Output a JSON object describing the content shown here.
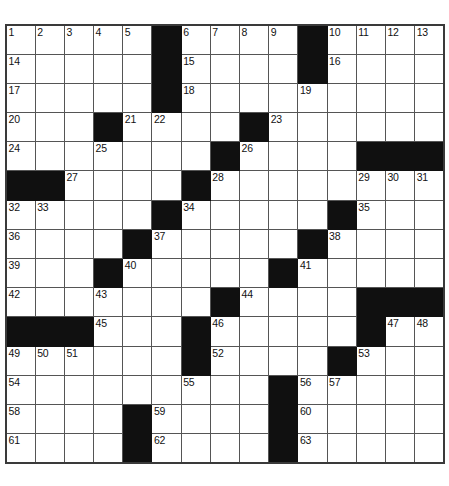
{
  "puzzle": {
    "type": "crossword-grid",
    "rows": 15,
    "cols": 15,
    "cell_size_px": 29.2,
    "colors": {
      "block_fill": "#101010",
      "cell_fill": "#ffffff",
      "grid_line": "#555555",
      "outer_border": "#3a3a3a",
      "number_text": "#111111"
    },
    "grid": [
      [
        {
          "block": false,
          "number": "1"
        },
        {
          "block": false,
          "number": "2"
        },
        {
          "block": false,
          "number": "3"
        },
        {
          "block": false,
          "number": "4"
        },
        {
          "block": false,
          "number": "5"
        },
        {
          "block": true,
          "number": ""
        },
        {
          "block": false,
          "number": "6"
        },
        {
          "block": false,
          "number": "7"
        },
        {
          "block": false,
          "number": "8"
        },
        {
          "block": false,
          "number": "9"
        },
        {
          "block": true,
          "number": ""
        },
        {
          "block": false,
          "number": "10"
        },
        {
          "block": false,
          "number": "11"
        },
        {
          "block": false,
          "number": "12"
        },
        {
          "block": false,
          "number": "13"
        }
      ],
      [
        {
          "block": false,
          "number": "14"
        },
        {
          "block": false,
          "number": ""
        },
        {
          "block": false,
          "number": ""
        },
        {
          "block": false,
          "number": ""
        },
        {
          "block": false,
          "number": ""
        },
        {
          "block": true,
          "number": ""
        },
        {
          "block": false,
          "number": "15"
        },
        {
          "block": false,
          "number": ""
        },
        {
          "block": false,
          "number": ""
        },
        {
          "block": false,
          "number": ""
        },
        {
          "block": true,
          "number": ""
        },
        {
          "block": false,
          "number": "16"
        },
        {
          "block": false,
          "number": ""
        },
        {
          "block": false,
          "number": ""
        },
        {
          "block": false,
          "number": ""
        }
      ],
      [
        {
          "block": false,
          "number": "17"
        },
        {
          "block": false,
          "number": ""
        },
        {
          "block": false,
          "number": ""
        },
        {
          "block": false,
          "number": ""
        },
        {
          "block": false,
          "number": ""
        },
        {
          "block": true,
          "number": ""
        },
        {
          "block": false,
          "number": "18"
        },
        {
          "block": false,
          "number": ""
        },
        {
          "block": false,
          "number": ""
        },
        {
          "block": false,
          "number": ""
        },
        {
          "block": false,
          "number": "19"
        },
        {
          "block": false,
          "number": ""
        },
        {
          "block": false,
          "number": ""
        },
        {
          "block": false,
          "number": ""
        },
        {
          "block": false,
          "number": ""
        }
      ],
      [
        {
          "block": false,
          "number": "20"
        },
        {
          "block": false,
          "number": ""
        },
        {
          "block": false,
          "number": ""
        },
        {
          "block": true,
          "number": ""
        },
        {
          "block": false,
          "number": "21"
        },
        {
          "block": false,
          "number": "22"
        },
        {
          "block": false,
          "number": ""
        },
        {
          "block": false,
          "number": ""
        },
        {
          "block": true,
          "number": ""
        },
        {
          "block": false,
          "number": "23"
        },
        {
          "block": false,
          "number": ""
        },
        {
          "block": false,
          "number": ""
        },
        {
          "block": false,
          "number": ""
        },
        {
          "block": false,
          "number": ""
        },
        {
          "block": false,
          "number": ""
        }
      ],
      [
        {
          "block": false,
          "number": "24"
        },
        {
          "block": false,
          "number": ""
        },
        {
          "block": false,
          "number": ""
        },
        {
          "block": false,
          "number": "25"
        },
        {
          "block": false,
          "number": ""
        },
        {
          "block": false,
          "number": ""
        },
        {
          "block": false,
          "number": ""
        },
        {
          "block": true,
          "number": ""
        },
        {
          "block": false,
          "number": "26"
        },
        {
          "block": false,
          "number": ""
        },
        {
          "block": false,
          "number": ""
        },
        {
          "block": false,
          "number": ""
        },
        {
          "block": true,
          "number": ""
        },
        {
          "block": true,
          "number": ""
        },
        {
          "block": true,
          "number": ""
        }
      ],
      [
        {
          "block": true,
          "number": ""
        },
        {
          "block": true,
          "number": ""
        },
        {
          "block": false,
          "number": "27"
        },
        {
          "block": false,
          "number": ""
        },
        {
          "block": false,
          "number": ""
        },
        {
          "block": false,
          "number": ""
        },
        {
          "block": true,
          "number": ""
        },
        {
          "block": false,
          "number": "28"
        },
        {
          "block": false,
          "number": ""
        },
        {
          "block": false,
          "number": ""
        },
        {
          "block": false,
          "number": ""
        },
        {
          "block": false,
          "number": ""
        },
        {
          "block": false,
          "number": "29"
        },
        {
          "block": false,
          "number": "30"
        },
        {
          "block": false,
          "number": "31"
        }
      ],
      [
        {
          "block": false,
          "number": "32"
        },
        {
          "block": false,
          "number": "33"
        },
        {
          "block": false,
          "number": ""
        },
        {
          "block": false,
          "number": ""
        },
        {
          "block": false,
          "number": ""
        },
        {
          "block": true,
          "number": ""
        },
        {
          "block": false,
          "number": "34"
        },
        {
          "block": false,
          "number": ""
        },
        {
          "block": false,
          "number": ""
        },
        {
          "block": false,
          "number": ""
        },
        {
          "block": false,
          "number": ""
        },
        {
          "block": true,
          "number": ""
        },
        {
          "block": false,
          "number": "35"
        },
        {
          "block": false,
          "number": ""
        },
        {
          "block": false,
          "number": ""
        }
      ],
      [
        {
          "block": false,
          "number": "36"
        },
        {
          "block": false,
          "number": ""
        },
        {
          "block": false,
          "number": ""
        },
        {
          "block": false,
          "number": ""
        },
        {
          "block": true,
          "number": ""
        },
        {
          "block": false,
          "number": "37"
        },
        {
          "block": false,
          "number": ""
        },
        {
          "block": false,
          "number": ""
        },
        {
          "block": false,
          "number": ""
        },
        {
          "block": false,
          "number": ""
        },
        {
          "block": true,
          "number": ""
        },
        {
          "block": false,
          "number": "38"
        },
        {
          "block": false,
          "number": ""
        },
        {
          "block": false,
          "number": ""
        },
        {
          "block": false,
          "number": ""
        }
      ],
      [
        {
          "block": false,
          "number": "39"
        },
        {
          "block": false,
          "number": ""
        },
        {
          "block": false,
          "number": ""
        },
        {
          "block": true,
          "number": ""
        },
        {
          "block": false,
          "number": "40"
        },
        {
          "block": false,
          "number": ""
        },
        {
          "block": false,
          "number": ""
        },
        {
          "block": false,
          "number": ""
        },
        {
          "block": false,
          "number": ""
        },
        {
          "block": true,
          "number": ""
        },
        {
          "block": false,
          "number": "41"
        },
        {
          "block": false,
          "number": ""
        },
        {
          "block": false,
          "number": ""
        },
        {
          "block": false,
          "number": ""
        },
        {
          "block": false,
          "number": ""
        }
      ],
      [
        {
          "block": false,
          "number": "42"
        },
        {
          "block": false,
          "number": ""
        },
        {
          "block": false,
          "number": ""
        },
        {
          "block": false,
          "number": "43"
        },
        {
          "block": false,
          "number": ""
        },
        {
          "block": false,
          "number": ""
        },
        {
          "block": false,
          "number": ""
        },
        {
          "block": true,
          "number": ""
        },
        {
          "block": false,
          "number": "44"
        },
        {
          "block": false,
          "number": ""
        },
        {
          "block": false,
          "number": ""
        },
        {
          "block": false,
          "number": ""
        },
        {
          "block": true,
          "number": ""
        },
        {
          "block": true,
          "number": ""
        },
        {
          "block": true,
          "number": ""
        }
      ],
      [
        {
          "block": true,
          "number": ""
        },
        {
          "block": true,
          "number": ""
        },
        {
          "block": true,
          "number": ""
        },
        {
          "block": false,
          "number": "45"
        },
        {
          "block": false,
          "number": ""
        },
        {
          "block": false,
          "number": ""
        },
        {
          "block": true,
          "number": ""
        },
        {
          "block": false,
          "number": "46"
        },
        {
          "block": false,
          "number": ""
        },
        {
          "block": false,
          "number": ""
        },
        {
          "block": false,
          "number": ""
        },
        {
          "block": false,
          "number": ""
        },
        {
          "block": true,
          "number": ""
        },
        {
          "block": false,
          "number": "47"
        },
        {
          "block": false,
          "number": "48"
        }
      ],
      [
        {
          "block": false,
          "number": "49"
        },
        {
          "block": false,
          "number": "50"
        },
        {
          "block": false,
          "number": "51"
        },
        {
          "block": false,
          "number": ""
        },
        {
          "block": false,
          "number": ""
        },
        {
          "block": false,
          "number": ""
        },
        {
          "block": true,
          "number": ""
        },
        {
          "block": false,
          "number": "52"
        },
        {
          "block": false,
          "number": ""
        },
        {
          "block": false,
          "number": ""
        },
        {
          "block": false,
          "number": ""
        },
        {
          "block": true,
          "number": ""
        },
        {
          "block": false,
          "number": "53"
        },
        {
          "block": false,
          "number": ""
        },
        {
          "block": false,
          "number": ""
        }
      ],
      [
        {
          "block": false,
          "number": "54"
        },
        {
          "block": false,
          "number": ""
        },
        {
          "block": false,
          "number": ""
        },
        {
          "block": false,
          "number": ""
        },
        {
          "block": false,
          "number": ""
        },
        {
          "block": false,
          "number": ""
        },
        {
          "block": false,
          "number": "55"
        },
        {
          "block": false,
          "number": ""
        },
        {
          "block": false,
          "number": ""
        },
        {
          "block": true,
          "number": ""
        },
        {
          "block": false,
          "number": "56"
        },
        {
          "block": false,
          "number": "57"
        },
        {
          "block": false,
          "number": ""
        },
        {
          "block": false,
          "number": ""
        },
        {
          "block": false,
          "number": ""
        }
      ],
      [
        {
          "block": false,
          "number": "58"
        },
        {
          "block": false,
          "number": ""
        },
        {
          "block": false,
          "number": ""
        },
        {
          "block": false,
          "number": ""
        },
        {
          "block": true,
          "number": ""
        },
        {
          "block": false,
          "number": "59"
        },
        {
          "block": false,
          "number": ""
        },
        {
          "block": false,
          "number": ""
        },
        {
          "block": false,
          "number": ""
        },
        {
          "block": true,
          "number": ""
        },
        {
          "block": false,
          "number": "60"
        },
        {
          "block": false,
          "number": ""
        },
        {
          "block": false,
          "number": ""
        },
        {
          "block": false,
          "number": ""
        },
        {
          "block": false,
          "number": ""
        }
      ],
      [
        {
          "block": false,
          "number": "61"
        },
        {
          "block": false,
          "number": ""
        },
        {
          "block": false,
          "number": ""
        },
        {
          "block": false,
          "number": ""
        },
        {
          "block": true,
          "number": ""
        },
        {
          "block": false,
          "number": "62"
        },
        {
          "block": false,
          "number": ""
        },
        {
          "block": false,
          "number": ""
        },
        {
          "block": false,
          "number": ""
        },
        {
          "block": true,
          "number": ""
        },
        {
          "block": false,
          "number": "63"
        },
        {
          "block": false,
          "number": ""
        },
        {
          "block": false,
          "number": ""
        },
        {
          "block": false,
          "number": ""
        },
        {
          "block": false,
          "number": ""
        }
      ]
    ]
  }
}
